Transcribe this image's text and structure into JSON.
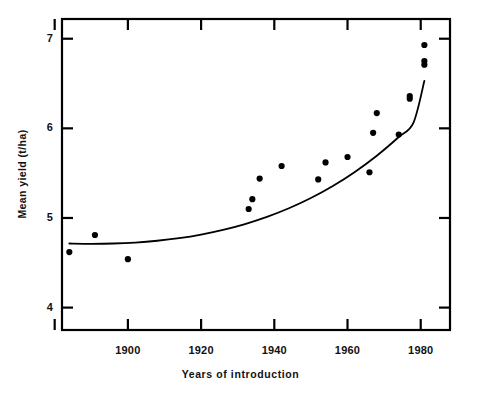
{
  "chart_data": {
    "type": "scatter",
    "title": "",
    "subtitle": "",
    "xlabel": "Years of introduction",
    "ylabel": "Mean yield (t/ha)",
    "xlim": [
      1882,
      1988
    ],
    "ylim": [
      3.75,
      7.22
    ],
    "grid": false,
    "legend": null,
    "legend_position": "none",
    "xticks": [
      1880,
      1900,
      1920,
      1940,
      1960,
      1980
    ],
    "xtick_labels": [
      "",
      "1900",
      "1920",
      "1940",
      "1960",
      "1980"
    ],
    "yticks": [
      4,
      5,
      6,
      7
    ],
    "ytick_labels": [
      "4",
      "5",
      "6",
      "7"
    ],
    "marker": "filled-circle",
    "marker_color": "#000000",
    "marker_size": 5,
    "points": [
      {
        "x": 1884,
        "y": 4.62
      },
      {
        "x": 1891,
        "y": 4.81
      },
      {
        "x": 1900,
        "y": 4.54
      },
      {
        "x": 1933,
        "y": 5.1
      },
      {
        "x": 1934,
        "y": 5.21
      },
      {
        "x": 1936,
        "y": 5.44
      },
      {
        "x": 1942,
        "y": 5.58
      },
      {
        "x": 1952,
        "y": 5.43
      },
      {
        "x": 1954,
        "y": 5.62
      },
      {
        "x": 1960,
        "y": 5.68
      },
      {
        "x": 1966,
        "y": 5.51
      },
      {
        "x": 1968,
        "y": 6.17
      },
      {
        "x": 1967,
        "y": 5.95
      },
      {
        "x": 1974,
        "y": 5.93
      },
      {
        "x": 1977,
        "y": 6.33
      },
      {
        "x": 1977,
        "y": 6.36
      },
      {
        "x": 1981,
        "y": 6.93
      },
      {
        "x": 1981,
        "y": 6.71
      },
      {
        "x": 1981,
        "y": 6.75
      }
    ],
    "fitted_curve": {
      "name": "fitted trend line",
      "style": "solid",
      "color": "#000000",
      "width": 1.8,
      "x_range": [
        1884,
        1981
      ],
      "points": [
        {
          "x": 1884,
          "y": 4.715
        },
        {
          "x": 1890,
          "y": 4.712
        },
        {
          "x": 1896,
          "y": 4.715
        },
        {
          "x": 1902,
          "y": 4.726
        },
        {
          "x": 1908,
          "y": 4.746
        },
        {
          "x": 1914,
          "y": 4.775
        },
        {
          "x": 1920,
          "y": 4.815
        },
        {
          "x": 1926,
          "y": 4.867
        },
        {
          "x": 1932,
          "y": 4.932
        },
        {
          "x": 1938,
          "y": 5.012
        },
        {
          "x": 1944,
          "y": 5.108
        },
        {
          "x": 1950,
          "y": 5.222
        },
        {
          "x": 1956,
          "y": 5.356
        },
        {
          "x": 1962,
          "y": 5.513
        },
        {
          "x": 1968,
          "y": 5.694
        },
        {
          "x": 1974,
          "y": 5.903
        },
        {
          "x": 1978,
          "y": 6.062
        },
        {
          "x": 1981,
          "y": 6.53
        }
      ]
    },
    "axes_style": {
      "frame": "box",
      "tick_direction": "in",
      "spine_color": "#000000",
      "spine_width": 2
    }
  }
}
